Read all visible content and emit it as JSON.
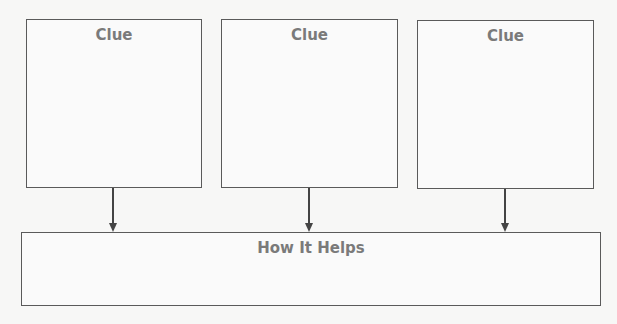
{
  "clues": [
    {
      "label": "Clue"
    },
    {
      "label": "Clue"
    },
    {
      "label": "Clue"
    }
  ],
  "result": {
    "label": "How It Helps"
  },
  "colors": {
    "border": "#5a5a5a",
    "text": "#7a7a7a",
    "background": "#f7f7f6"
  }
}
